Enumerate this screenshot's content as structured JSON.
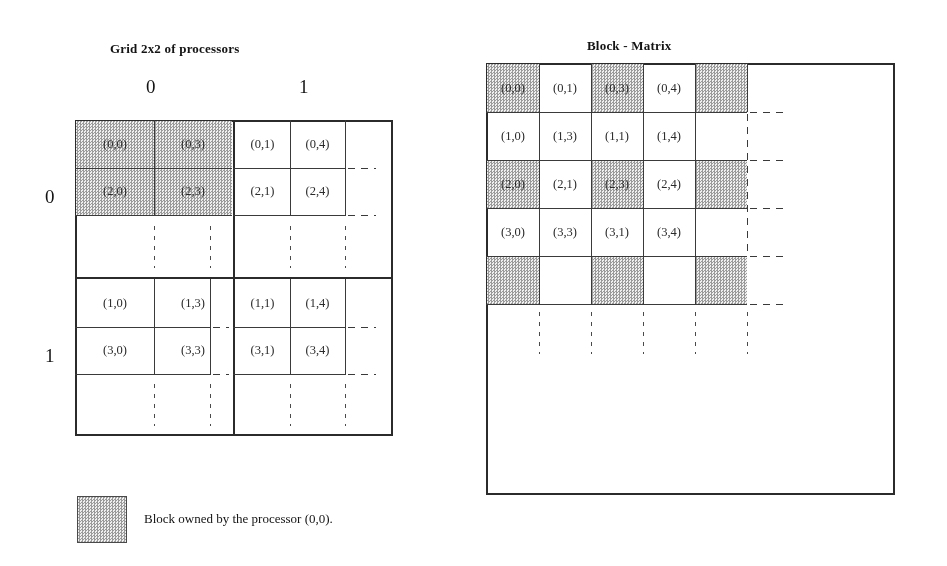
{
  "page": {
    "background": "#ffffff",
    "ink": "#2b2b2b",
    "shade_color": "#d9d9d9"
  },
  "left_figure": {
    "title": "Grid 2x2 of processors",
    "column_headers": [
      "0",
      "1"
    ],
    "row_headers": [
      "0",
      "1"
    ],
    "quadrants": [
      {
        "processor": "(0,0)",
        "row": 0,
        "col": 0,
        "cells": [
          {
            "label": "(0,0)",
            "shaded": true
          },
          {
            "label": "(0,3)",
            "shaded": true
          },
          {
            "label": "(2,0)",
            "shaded": true
          },
          {
            "label": "(2,3)",
            "shaded": true
          }
        ]
      },
      {
        "processor": "(0,1)",
        "row": 0,
        "col": 1,
        "cells": [
          {
            "label": "(0,1)",
            "shaded": false
          },
          {
            "label": "(0,4)",
            "shaded": false
          },
          {
            "label": "(2,1)",
            "shaded": false
          },
          {
            "label": "(2,4)",
            "shaded": false
          }
        ]
      },
      {
        "processor": "(1,0)",
        "row": 1,
        "col": 0,
        "cells": [
          {
            "label": "(1,0)",
            "shaded": false
          },
          {
            "label": "(1,3)",
            "shaded": false
          },
          {
            "label": "(3,0)",
            "shaded": false
          },
          {
            "label": "(3,3)",
            "shaded": false
          }
        ]
      },
      {
        "processor": "(1,1)",
        "row": 1,
        "col": 1,
        "cells": [
          {
            "label": "(1,1)",
            "shaded": false
          },
          {
            "label": "(1,4)",
            "shaded": false
          },
          {
            "label": "(3,1)",
            "shaded": false
          },
          {
            "label": "(3,4)",
            "shaded": false
          }
        ]
      }
    ]
  },
  "right_figure": {
    "title": "Block - Matrix",
    "rows": [
      [
        {
          "label": "(0,0)",
          "shaded": true
        },
        {
          "label": "(0,1)",
          "shaded": false
        },
        {
          "label": "(0,3)",
          "shaded": true
        },
        {
          "label": "(0,4)",
          "shaded": false
        },
        {
          "label": "",
          "shaded": true
        }
      ],
      [
        {
          "label": "(1,0)",
          "shaded": false
        },
        {
          "label": "(1,3)",
          "shaded": false
        },
        {
          "label": "(1,1)",
          "shaded": false
        },
        {
          "label": "(1,4)",
          "shaded": false
        },
        {
          "label": "",
          "shaded": false
        }
      ],
      [
        {
          "label": "(2,0)",
          "shaded": true
        },
        {
          "label": "(2,1)",
          "shaded": false
        },
        {
          "label": "(2,3)",
          "shaded": true
        },
        {
          "label": "(2,4)",
          "shaded": false
        },
        {
          "label": "",
          "shaded": true
        }
      ],
      [
        {
          "label": "(3,0)",
          "shaded": false
        },
        {
          "label": "(3,3)",
          "shaded": false
        },
        {
          "label": "(3,1)",
          "shaded": false
        },
        {
          "label": "(3,4)",
          "shaded": false
        },
        {
          "label": "",
          "shaded": false
        }
      ],
      [
        {
          "label": "",
          "shaded": true
        },
        {
          "label": "",
          "shaded": false
        },
        {
          "label": "",
          "shaded": true
        },
        {
          "label": "",
          "shaded": false
        },
        {
          "label": "",
          "shaded": true
        }
      ]
    ]
  },
  "legend": {
    "swatch_name": "shaded-block-swatch",
    "text": "Block owned by the processor (0,0)."
  }
}
